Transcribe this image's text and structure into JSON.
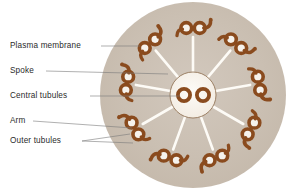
{
  "figure": {
    "background_color": "#ffffff"
  },
  "colors": {
    "membrane_fill": "#c9bdb0",
    "membrane_fill_inner": "#cdc2b6",
    "tubule_stroke": "#8a4b1e",
    "tubule_fill": "#f6f2ec",
    "hub_fill": "#faf7f1",
    "hub_stroke": "#8a6a4a",
    "spoke_color": "#fdfbf6",
    "leader_line": "#7a7a7a",
    "label_text": "#2b2b2b"
  },
  "labels": [
    {
      "id": "plasma-membrane",
      "text": "Plasma membrane",
      "text_x": 10,
      "text_y": 46,
      "leader": "M 101 46 L 140 46"
    },
    {
      "id": "spoke",
      "text": "Spoke",
      "text_x": 10,
      "text_y": 71,
      "leader": "M 46 71 L 168 74"
    },
    {
      "id": "central-tubules",
      "text": "Central tubules",
      "text_x": 10,
      "text_y": 96,
      "leader": "M 90 96 L 180 96"
    },
    {
      "id": "arm",
      "text": "Arm",
      "text_x": 10,
      "text_y": 121,
      "leader": "M 33 121 L 132 128"
    },
    {
      "id": "outer-tubules",
      "text": "Outer tubules",
      "text_x": 10,
      "text_y": 141,
      "leader": "M 82 141 L 130 134 M 82 141 L 133 143"
    }
  ],
  "structure": {
    "membrane": {
      "cx": 193,
      "cy": 95,
      "r": 93
    },
    "central_hub": {
      "cx": 193,
      "cy": 95,
      "r": 23
    },
    "central_tubules": [
      {
        "cx": 184,
        "cy": 95,
        "r_outer": 8.0,
        "r_inner": 4.2
      },
      {
        "cx": 203,
        "cy": 95,
        "r_outer": 8.0,
        "r_inner": 4.2
      }
    ],
    "outer_doublets": {
      "count": 9,
      "ring_radius": 67,
      "start_angle_deg": -90,
      "tubule_radius_outer": 7.2,
      "tubule_radius_inner": 3.6,
      "tubule_separation": 13.5
    },
    "spokes": {
      "count": 9,
      "inner_radius": 23,
      "outer_radius": 58,
      "width": 2.6
    }
  }
}
